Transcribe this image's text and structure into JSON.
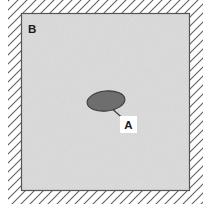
{
  "figure": {
    "title": "",
    "background_color": "#ffffff",
    "region": {
      "name": "concrete-region",
      "label": "B",
      "fill_color": "#e3e3e3",
      "texture": "speckled-noise",
      "border_color": "#555555",
      "bounds": {
        "x": 21,
        "y": 13,
        "width": 169,
        "height": 178
      }
    },
    "hatching": {
      "name": "fixed-support-hatching",
      "direction": "forward-slash",
      "spacing": 9,
      "color": "#606060",
      "line_width": 1.1,
      "band_width": 13
    },
    "inclusion": {
      "name": "elliptical-inclusion",
      "label": "A",
      "fill_color": "#6e6e6e",
      "stroke_color": "#3c3c3c",
      "center": {
        "x": 106,
        "y": 101
      },
      "radius_x": 19,
      "radius_y": 10,
      "rotation_deg": -6
    },
    "leader": {
      "name": "leader-line",
      "color": "#3c3c3c",
      "from": {
        "x": 110,
        "y": 109
      },
      "to": {
        "x": 125,
        "y": 121
      }
    },
    "labels": [
      {
        "id": "label-a",
        "text": "A",
        "x": 128,
        "y": 129,
        "boxed": true
      },
      {
        "id": "label-b",
        "text": "B",
        "x": 32,
        "y": 33,
        "boxed": false
      }
    ]
  }
}
